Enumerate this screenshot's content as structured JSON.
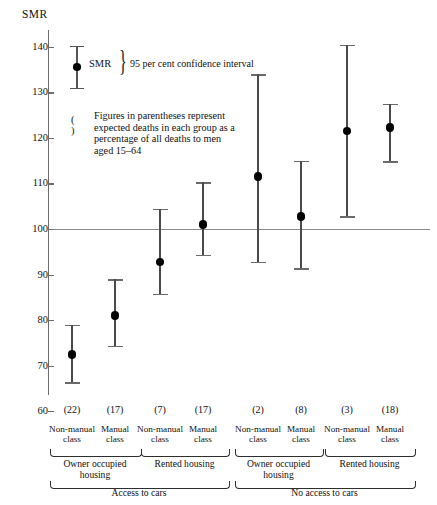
{
  "chart_data": {
    "type": "scatter",
    "title": "",
    "ylabel": "SMR",
    "ylim": [
      60,
      140
    ],
    "yticks": [
      60,
      70,
      80,
      90,
      100,
      110,
      120,
      130,
      140
    ],
    "reference_line": 100,
    "grid": false,
    "legend_position": "inside-top-left",
    "categories": [
      "Non-manual class",
      "Manual class",
      "Non-manual class",
      "Manual class",
      "Non-manual class",
      "Manual class",
      "Non-manual class",
      "Manual class"
    ],
    "values": [
      72.5,
      81.0,
      92.7,
      101.0,
      111.5,
      102.8,
      121.5,
      122.3
    ],
    "ci_lower": [
      66.0,
      74.0,
      85.5,
      94.0,
      92.5,
      91.0,
      102.5,
      114.5
    ],
    "ci_upper": [
      79.0,
      89.0,
      104.5,
      110.3,
      134.0,
      115.0,
      140.5,
      127.5
    ],
    "point_labels": [
      "(22)",
      "(17)",
      "(7)",
      "(17)",
      "(2)",
      "(8)",
      "(3)",
      "(18)"
    ],
    "annotations": [
      "SMR",
      "95 per cent confidence interval",
      "(  )  Figures in parentheses represent expected deaths in each group as a percentage of all deaths to men aged 15-64"
    ]
  },
  "axis": {
    "title": "SMR",
    "ticks": [
      "140",
      "130",
      "120",
      "110",
      "100",
      "90",
      "80",
      "70",
      "60"
    ]
  },
  "legend": {
    "smr_label": "SMR",
    "ci_label": "95 per cent confidence interval",
    "paren_symbol": "(   )",
    "note_line1": "Figures in parentheses represent",
    "note_line2": "expected deaths in each group as a",
    "note_line3": "percentage of all deaths to men",
    "note_line4": "aged 15–64"
  },
  "xaxis": {
    "percentages": [
      "(22)",
      "(17)",
      "(7)",
      "(17)",
      "(2)",
      "(8)",
      "(3)",
      "(18)"
    ],
    "class_labels": [
      {
        "l1": "Non-manual",
        "l2": "class"
      },
      {
        "l1": "Manual",
        "l2": "class"
      },
      {
        "l1": "Non-manual",
        "l2": "class"
      },
      {
        "l1": "Manual",
        "l2": "class"
      },
      {
        "l1": "Non-manual",
        "l2": "class"
      },
      {
        "l1": "Manual",
        "l2": "class"
      },
      {
        "l1": "Non-manual",
        "l2": "class"
      },
      {
        "l1": "Manual",
        "l2": "class"
      }
    ],
    "housing_groups": [
      {
        "l1": "Owner occupied",
        "l2": "housing"
      },
      {
        "l1": "Rented housing",
        "l2": ""
      },
      {
        "l1": "Owner occupied",
        "l2": "housing"
      },
      {
        "l1": "Rented housing",
        "l2": ""
      }
    ],
    "car_groups": [
      "Access to cars",
      "No access to cars"
    ]
  }
}
